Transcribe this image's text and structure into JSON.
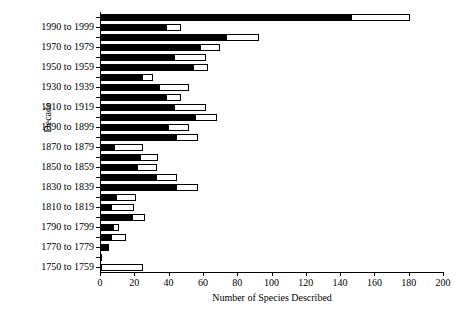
{
  "chart_data": {
    "type": "bar",
    "orientation": "horizontal",
    "title": "",
    "xlabel": "Number of Species Described",
    "ylabel": "Decade",
    "xlim": [
      0,
      200
    ],
    "xticks": [
      0,
      20,
      40,
      60,
      80,
      100,
      120,
      140,
      160,
      180,
      200
    ],
    "grid": false,
    "legend": null,
    "series": [
      {
        "name": "black-segment",
        "color": "#000000"
      },
      {
        "name": "white-segment",
        "color": "#ffffff"
      }
    ],
    "note": "Each decade has two stacked-style bars: a filled black bar and an open (white, outlined) bar drawn to a larger total.",
    "categories": [
      "2000 to 2009",
      "1990 to 1999",
      "1980 to 1989",
      "1970 to 1979",
      "1960 to 1969",
      "1950 to 1959",
      "1940 to 1949",
      "1930 to 1939",
      "1920 to 1929",
      "1910 to 1919",
      "1900 to 1909",
      "1890 to 1899",
      "1880 to 1889",
      "1870 to 1879",
      "1860 to 1869",
      "1850 to 1859",
      "1840 to 1849",
      "1830 to 1839",
      "1820 to 1829",
      "1810 to 1819",
      "1800 to 1809",
      "1790 to 1799",
      "1780 to 1789",
      "1770 to 1779",
      "1760 to 1769",
      "1750 to 1759"
    ],
    "visible_tick_labels": [
      "1990 to 1999",
      "1970 to 1979",
      "1950 to 1959",
      "1930 to 1939",
      "1910 to 1919",
      "1890 to 1899",
      "1870 to 1879",
      "1850 to 1859",
      "1830 to 1839",
      "1810 to 1819",
      "1790 to 1799",
      "1770 to 1779",
      "1750 to 1759"
    ],
    "black_values": [
      147,
      39,
      74,
      59,
      44,
      55,
      25,
      35,
      39,
      44,
      56,
      40,
      45,
      9,
      24,
      22,
      33,
      45,
      10,
      7,
      19,
      8,
      7,
      5,
      1,
      1
    ],
    "white_values": [
      181,
      47,
      93,
      70,
      62,
      63,
      31,
      52,
      47,
      62,
      68,
      52,
      57,
      25,
      34,
      33,
      45,
      57,
      21,
      20,
      26,
      11,
      15,
      5,
      1,
      25
    ]
  },
  "axes": {
    "xlabel": "Number of Species Described",
    "ylabel": "Decade"
  }
}
